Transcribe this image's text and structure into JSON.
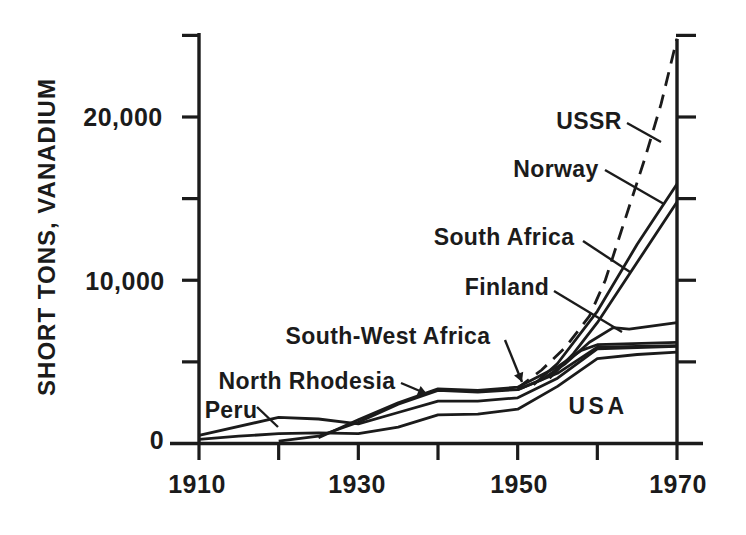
{
  "figure": {
    "background": "#ffffff",
    "ink_color": "#1b1b1b"
  },
  "chart_data": {
    "type": "line",
    "title": "",
    "xlabel": "",
    "ylabel": "SHORT TONS, VANADIUM",
    "xlim": [
      1910,
      1970
    ],
    "ylim": [
      0,
      25000
    ],
    "x_ticks": [
      1910,
      1920,
      1930,
      1940,
      1950,
      1960,
      1970
    ],
    "y_ticks": [
      0,
      5000,
      10000,
      15000,
      20000,
      25000
    ],
    "grid": false,
    "legend_position": "inline-annotations",
    "x_tick_labels": [
      {
        "text": "1910",
        "x": 197,
        "y": 484
      },
      {
        "text": "1930",
        "x": 357,
        "y": 484
      },
      {
        "text": "1950",
        "x": 519,
        "y": 484
      },
      {
        "text": "1970",
        "x": 678,
        "y": 484
      }
    ],
    "y_tick_labels": [
      {
        "text": "20,000",
        "x": 123,
        "y": 117
      },
      {
        "text": "10,000",
        "x": 125,
        "y": 281
      },
      {
        "text": "0",
        "x": 157,
        "y": 440
      }
    ],
    "series": [
      {
        "name": "USA",
        "style": "solid",
        "points": [
          [
            1910,
            250
          ],
          [
            1915,
            450
          ],
          [
            1920,
            600
          ],
          [
            1925,
            650
          ],
          [
            1930,
            600
          ],
          [
            1935,
            1000
          ],
          [
            1940,
            1750
          ],
          [
            1945,
            1800
          ],
          [
            1950,
            2100
          ],
          [
            1955,
            3500
          ],
          [
            1960,
            5200
          ],
          [
            1965,
            5450
          ],
          [
            1970,
            5600
          ]
        ]
      },
      {
        "name": "Peru",
        "style": "solid",
        "points": [
          [
            1910,
            500
          ],
          [
            1920,
            1600
          ],
          [
            1925,
            1500
          ],
          [
            1930,
            1200
          ],
          [
            1935,
            1900
          ],
          [
            1940,
            2600
          ],
          [
            1945,
            2600
          ],
          [
            1950,
            2800
          ],
          [
            1955,
            4000
          ],
          [
            1960,
            5800
          ],
          [
            1970,
            5950
          ]
        ]
      },
      {
        "name": "North Rhodesia",
        "style": "solid",
        "points": [
          [
            1920,
            150
          ],
          [
            1925,
            450
          ],
          [
            1930,
            1300
          ],
          [
            1935,
            2400
          ],
          [
            1940,
            3250
          ],
          [
            1945,
            3150
          ],
          [
            1950,
            3300
          ],
          [
            1955,
            4300
          ],
          [
            1960,
            5900
          ],
          [
            1970,
            6000
          ]
        ]
      },
      {
        "name": "South-West Africa",
        "style": "solid",
        "points": [
          [
            1925,
            350
          ],
          [
            1930,
            1450
          ],
          [
            1935,
            2500
          ],
          [
            1940,
            3350
          ],
          [
            1945,
            3250
          ],
          [
            1950,
            3450
          ],
          [
            1955,
            4700
          ],
          [
            1958,
            5700
          ],
          [
            1960,
            6050
          ],
          [
            1970,
            6200
          ]
        ]
      },
      {
        "name": "Finland",
        "style": "solid",
        "points": [
          [
            1950,
            3300
          ],
          [
            1953,
            3900
          ],
          [
            1956,
            4900
          ],
          [
            1959,
            6200
          ],
          [
            1962,
            7100
          ],
          [
            1964,
            7000
          ],
          [
            1970,
            7400
          ]
        ]
      },
      {
        "name": "Norway",
        "style": "solid",
        "points": [
          [
            1952,
            3600
          ],
          [
            1955,
            4900
          ],
          [
            1960,
            8100
          ],
          [
            1965,
            12200
          ],
          [
            1970,
            15900
          ]
        ]
      },
      {
        "name": "South Africa",
        "style": "solid",
        "points": [
          [
            1954,
            4000
          ],
          [
            1957,
            5500
          ],
          [
            1960,
            7400
          ],
          [
            1965,
            11100
          ],
          [
            1970,
            14800
          ]
        ]
      },
      {
        "name": "USSR",
        "style": "dashed",
        "points": [
          [
            1950,
            3400
          ],
          [
            1953,
            4500
          ],
          [
            1956,
            5900
          ],
          [
            1959,
            7800
          ],
          [
            1961,
            10000
          ],
          [
            1963,
            13000
          ],
          [
            1966,
            17500
          ],
          [
            1968,
            20800
          ],
          [
            1970,
            24800
          ]
        ]
      }
    ],
    "annotations": [
      {
        "label": "USSR",
        "x": 589,
        "y": 121,
        "leader": [
          627,
          123,
          661,
          142
        ],
        "arrow": false
      },
      {
        "label": "Norway",
        "x": 556,
        "y": 169,
        "leader": [
          605,
          170,
          664,
          204
        ],
        "arrow": false
      },
      {
        "label": "South Africa",
        "x": 504,
        "y": 237,
        "leader": [
          583,
          241,
          630,
          272
        ],
        "arrow": false
      },
      {
        "label": "Finland",
        "x": 507,
        "y": 287,
        "leader": [
          554,
          291,
          622,
          332
        ],
        "arrow": false
      },
      {
        "label": "South-West Africa",
        "x": 388,
        "y": 336,
        "leader": [
          505,
          340,
          522,
          382
        ],
        "arrow": true
      },
      {
        "label": "North Rhodesia",
        "x": 307,
        "y": 381,
        "leader": [
          401,
          383,
          427,
          394
        ],
        "arrow": true
      },
      {
        "label": "Peru",
        "x": 231,
        "y": 410,
        "leader": [
          257,
          407,
          278,
          427
        ],
        "arrow": false
      },
      {
        "label": "USA",
        "x": 598,
        "y": 406,
        "leader": null,
        "arrow": false
      }
    ]
  }
}
